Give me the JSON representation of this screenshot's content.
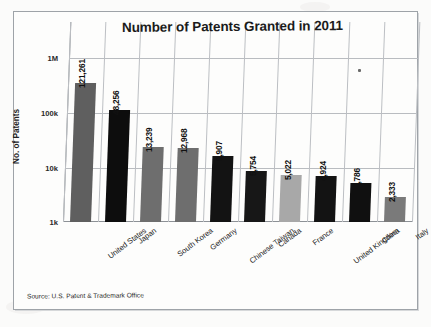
{
  "chart_data": {
    "type": "bar",
    "title": "Number of Patents Granted in 2011",
    "xlabel": "",
    "ylabel": "No. of Patents",
    "yscale": "log",
    "ylim": [
      1000,
      1000000
    ],
    "ytick_labels": [
      "1M",
      "100k",
      "10k",
      "1k"
    ],
    "ytick_values": [
      1000000,
      100000,
      10000,
      1000
    ],
    "grid": true,
    "legend": "none",
    "source": "Source: U.S. Patent & Trademark Office",
    "categories": [
      "United States",
      "Japan",
      "South Korea",
      "Germany",
      "Chinese Taiwan",
      "Canada",
      "France",
      "United Kingdom",
      "China",
      "Italy"
    ],
    "values": [
      121261,
      48256,
      13239,
      12968,
      9907,
      5754,
      5022,
      4924,
      3786,
      2333
    ],
    "value_labels": [
      "121,261",
      "48,256",
      "13,239",
      "12,968",
      "9,907",
      "5,754",
      "5,022",
      "4,924",
      "3,786",
      "2,333"
    ],
    "bar_colors": [
      "#5f5f5f",
      "#0d0d0d",
      "#6e6e6e",
      "#6e6e6e",
      "#131313",
      "#171717",
      "#a8a8a8",
      "#131313",
      "#101010",
      "#7a7a7a"
    ]
  },
  "colors": {
    "page_background": "#fdfdfc",
    "frame": "#9ea3a8",
    "gridline": "#b9bcc0",
    "axis": "#8d9196",
    "text": "#1b1b1b"
  }
}
